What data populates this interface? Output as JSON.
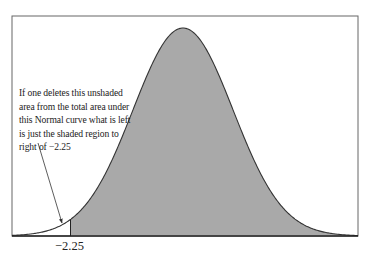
{
  "chart_data": {
    "type": "area",
    "title": "",
    "distribution": "Normal (standard)",
    "xlabel": "",
    "ylabel": "",
    "tick_labels": [
      "−2.25"
    ],
    "cutoff_z": -2.25,
    "shaded_region": "right of −2.25",
    "unshaded_region": "left of −2.25",
    "x_range_z": [
      -3.4,
      3.5
    ],
    "grid": false,
    "legend": null,
    "annotation": {
      "lines": [
        "If one deletes this unshaded",
        "area from the total area under",
        "this Normal curve what is left",
        "is just the shaded region to",
        "right of −2.25"
      ],
      "arrow_points_to": "unshaded left tail"
    },
    "colors": {
      "shaded_fill": "#a9a9a9",
      "curve_stroke": "#333333",
      "frame": "#555555",
      "unshaded_fill": "#ffffff"
    }
  }
}
